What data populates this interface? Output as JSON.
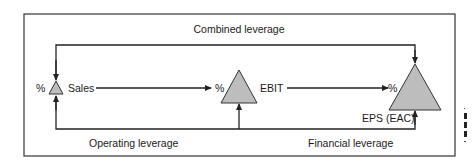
{
  "diagram": {
    "title_top": "Combined leverage",
    "nodes": [
      {
        "id": "sales",
        "label": "Sales",
        "prefix": "%"
      },
      {
        "id": "ebit",
        "label": "EBIT",
        "prefix": "%"
      },
      {
        "id": "eps",
        "label": "EPS (EAC)",
        "prefix": "%"
      }
    ],
    "bottom_labels": {
      "operating": "Operating leverage",
      "financial": "Financial leverage"
    },
    "colors": {
      "triangle_fill": "#bdbdbd",
      "stroke": "#222222",
      "border": "#333333"
    }
  }
}
